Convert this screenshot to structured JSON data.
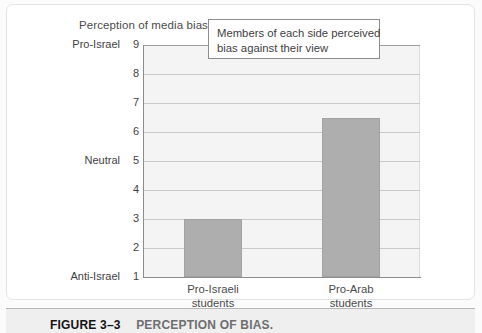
{
  "figure": {
    "number": "FIGURE 3–3",
    "caption": "PERCEPTION OF BIAS."
  },
  "chart_title": "Perception of media bias",
  "callout": {
    "line1": "Members of each side perceived",
    "line2": "bias against their view"
  },
  "axis_names": {
    "top": "Pro-Israel",
    "middle": "Neutral",
    "bottom": "Anti-Israel"
  },
  "colors": {
    "bar_fill": "#aeaeae",
    "bar_stroke": "#a2a2a2",
    "plot_bg": "#f4f4f4",
    "gridline": "#c9c9c9",
    "axis": "#8c8c8c",
    "caption_bar": "#efefef",
    "text": "#3f3f3f"
  },
  "chart_data": {
    "type": "bar",
    "title": "Perception of media bias",
    "xlabel": "",
    "ylabel": "",
    "categories": [
      "Pro-Israeli students",
      "Pro-Arab students"
    ],
    "category_lines": [
      [
        "Pro-Israeli",
        "students"
      ],
      [
        "Pro-Arab",
        "students"
      ]
    ],
    "values": [
      3,
      6.5
    ],
    "ylim": [
      1,
      9
    ],
    "yticks": [
      1,
      2,
      3,
      4,
      5,
      6,
      7,
      8,
      9
    ],
    "ytick_labels": [
      "1",
      "2",
      "3",
      "4",
      "5",
      "6",
      "7",
      "8",
      "9"
    ],
    "ytick_named": {
      "1": "Anti-Israel",
      "5": "Neutral",
      "9": "Pro-Israel"
    },
    "grid": true,
    "legend": false,
    "annotations": [
      "Members of each side perceived bias against their view"
    ]
  }
}
